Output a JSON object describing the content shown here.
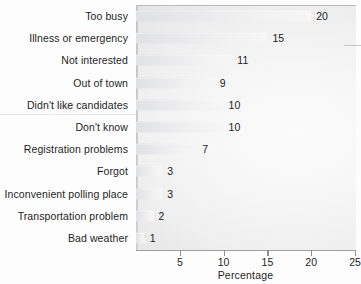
{
  "chart_data": {
    "type": "bar",
    "orientation": "horizontal",
    "title": "",
    "xlabel": "Percentage",
    "ylabel": "",
    "xlim": [
      0,
      25
    ],
    "xticks": [
      5,
      10,
      15,
      20,
      25
    ],
    "xtick_labels": [
      "5",
      "10",
      "15",
      "20",
      "25"
    ],
    "grid": false,
    "legend": null,
    "categories": [
      "Too busy",
      "Illness or emergency",
      "Not interested",
      "Out of town",
      "Didn't like candidates",
      "Don't know",
      "Registration problems",
      "Forgot",
      "Inconvenient polling place",
      "Transportation problem",
      "Bad weather"
    ],
    "values": [
      20,
      15,
      11,
      9,
      10,
      10,
      7,
      3,
      3,
      2,
      1
    ],
    "value_labels": [
      "20",
      "15",
      "11",
      "9",
      "10",
      "10",
      "7",
      "3",
      "3",
      "2",
      "1"
    ],
    "bar_color": "#eaeaec",
    "text_color": "#1d1d1f",
    "axis_color": "#9d9ea0",
    "panel_background": "#efeff0"
  }
}
